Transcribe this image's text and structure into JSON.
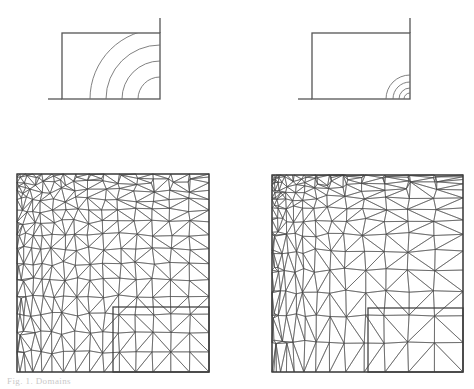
{
  "figure": {
    "caption": "Fig. 1. Domains",
    "stroke_color": "#555555",
    "mesh_stroke_color": "#4a4a4a",
    "contour_color": "#6a6a6a",
    "background": "#ffffff",
    "panels": [
      {
        "id": "top-left",
        "name": "contour-panel-coarse",
        "type": "contour-diagram",
        "label": "",
        "rect": {
          "x": 62,
          "y": 33,
          "w": 98,
          "h": 66
        },
        "tail_top": {
          "x": 160,
          "y": 18,
          "len": 15
        },
        "tail_left": {
          "x": 48,
          "y": 99,
          "len": 14
        },
        "arc_center": {
          "x": 160,
          "y": 99
        },
        "arc_radii": [
          22,
          38,
          54,
          70
        ],
        "arc_count": 4,
        "description": "Rectangular domain with four widely spaced concentric quarter-circle contours centred on the bottom-right corner."
      },
      {
        "id": "top-right",
        "name": "contour-panel-fine",
        "type": "contour-diagram",
        "label": "",
        "rect": {
          "x": 312,
          "y": 33,
          "w": 98,
          "h": 66
        },
        "tail_top": {
          "x": 410,
          "y": 18,
          "len": 15
        },
        "tail_left": {
          "x": 298,
          "y": 99,
          "len": 14
        },
        "arc_center": {
          "x": 410,
          "y": 99
        },
        "arc_radii": [
          6,
          11,
          17,
          24
        ],
        "arc_count": 4,
        "description": "Same rectangular domain where the four contours are compressed into a thin boundary layer at the bottom-right corner."
      },
      {
        "id": "bottom-left",
        "name": "mesh-panel-coarse",
        "type": "triangular-mesh",
        "label": "",
        "rect": {
          "x": 17,
          "y": 174,
          "w": 192,
          "h": 198
        },
        "inset": {
          "x": 113,
          "y": 307,
          "w": 96,
          "h": 65
        },
        "grading": "moderate",
        "description": "Unstructured triangular mesh on a square, graded toward the bottom-right inset region."
      },
      {
        "id": "bottom-right",
        "name": "mesh-panel-fine",
        "type": "triangular-mesh",
        "label": "",
        "rect": {
          "x": 272,
          "y": 175,
          "w": 191,
          "h": 197
        },
        "inset": {
          "x": 368,
          "y": 308,
          "w": 95,
          "h": 64
        },
        "grading": "strong",
        "description": "Unstructured triangular mesh on a square with much stronger grading concentrated at the bottom-right corner."
      }
    ]
  }
}
